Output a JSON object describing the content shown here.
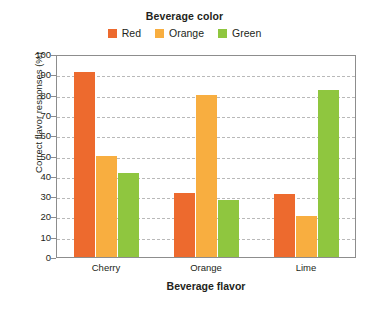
{
  "chart_data": {
    "type": "bar",
    "title": "",
    "xlabel": "Beverage flavor",
    "ylabel": "Correct flavor responses (%)",
    "categories": [
      "Cherry",
      "Orange",
      "Lime"
    ],
    "series": [
      {
        "name": "Red",
        "color": "#ED6A2E",
        "values": [
          91,
          31.5,
          31
        ]
      },
      {
        "name": "Orange",
        "color": "#F8AE40",
        "values": [
          50,
          80,
          20
        ]
      },
      {
        "name": "Green",
        "color": "#8FC63F",
        "values": [
          41.5,
          28,
          82.5
        ]
      }
    ],
    "ylim": [
      0,
      100
    ],
    "yticks": [
      100,
      90,
      80,
      70,
      60,
      50,
      40,
      30,
      20,
      10,
      0
    ],
    "grid": true,
    "legend": {
      "title": "Beverage color",
      "position": "top",
      "entries": [
        "Red",
        "Orange",
        "Green"
      ]
    }
  },
  "legend": {
    "title": "Beverage color",
    "items": [
      {
        "label": "Red",
        "color": "#ED6A2E"
      },
      {
        "label": "Orange",
        "color": "#F8AE40"
      },
      {
        "label": "Green",
        "color": "#8FC63F"
      }
    ]
  },
  "axes": {
    "y_title": "Correct flavor responses (%)",
    "x_title": "Beverage flavor",
    "y_ticks": [
      "100",
      "90",
      "80",
      "70",
      "60",
      "50",
      "40",
      "30",
      "20",
      "10",
      "0"
    ],
    "x_ticks": [
      "Cherry",
      "Orange",
      "Lime"
    ]
  }
}
